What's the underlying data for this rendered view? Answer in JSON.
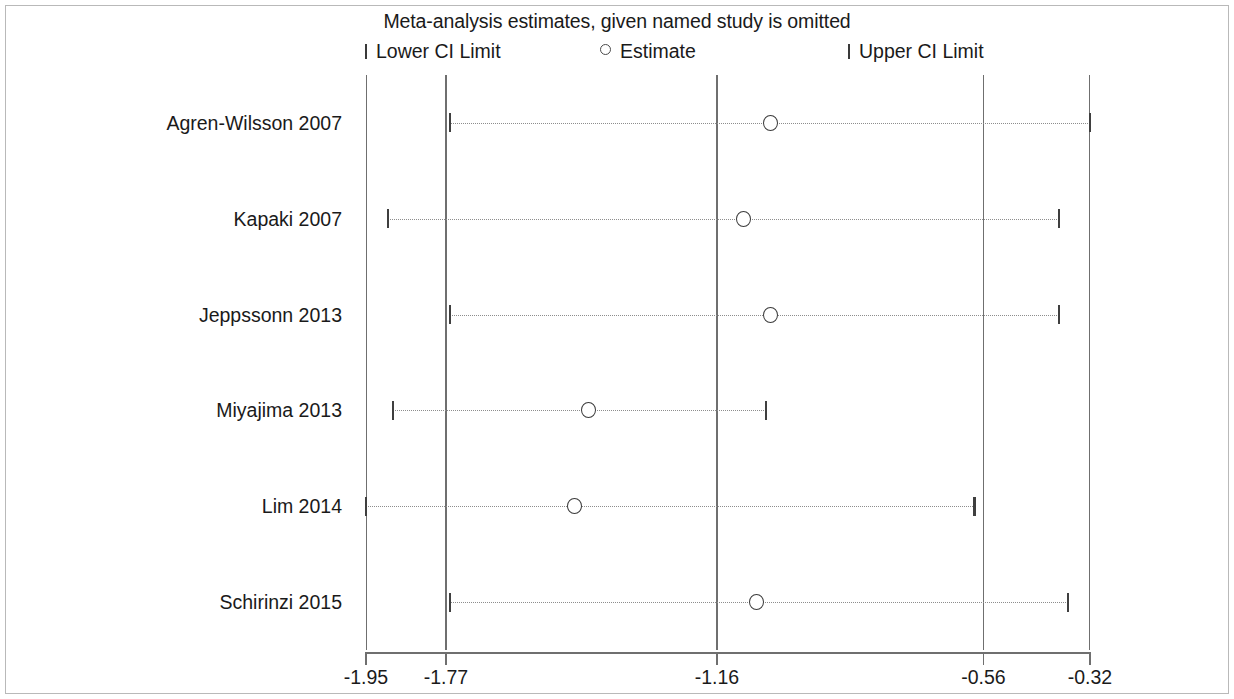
{
  "chart_data": {
    "type": "scatter",
    "title": "Meta-analysis estimates, given named study is omitted",
    "xlabel": "",
    "ylabel": "",
    "xlim": [
      -1.95,
      -0.32
    ],
    "grid": false,
    "legend_position": "top",
    "legend": [
      {
        "key": "lower-ci-limit",
        "marker": "tick",
        "label": "Lower CI Limit"
      },
      {
        "key": "estimate",
        "marker": "circle",
        "label": "Estimate"
      },
      {
        "key": "upper-ci-limit",
        "marker": "tick",
        "label": "Upper CI Limit"
      }
    ],
    "xticks": [
      -1.95,
      -1.77,
      -1.16,
      -0.56,
      -0.32
    ],
    "xticklabels": [
      "-1.95",
      "-1.77",
      "-1.16",
      "-0.56",
      "-0.32"
    ],
    "reference_lines": [
      -1.77,
      -1.16,
      -0.56
    ],
    "categories": [
      "Agren-Wilsson 2007",
      "Kapaki 2007",
      "Jeppssonn 2013",
      "Miyajima 2013",
      "Lim 2014",
      "Schirinzi 2015"
    ],
    "series": [
      {
        "name": "Lower CI Limit",
        "values": [
          -1.76,
          -1.9,
          -1.76,
          -1.89,
          -1.95,
          -1.76
        ]
      },
      {
        "name": "Estimate",
        "values": [
          -1.04,
          -1.1,
          -1.04,
          -1.45,
          -1.48,
          -1.07
        ]
      },
      {
        "name": "Upper CI Limit",
        "values": [
          -0.32,
          -0.39,
          -0.39,
          -1.05,
          -0.58,
          -0.37
        ]
      }
    ],
    "rows": [
      {
        "study": "Agren-Wilsson 2007",
        "lower": -1.76,
        "estimate": -1.04,
        "upper": -0.32
      },
      {
        "study": "Kapaki 2007",
        "lower": -1.9,
        "estimate": -1.1,
        "upper": -0.39
      },
      {
        "study": "Jeppssonn 2013",
        "lower": -1.76,
        "estimate": -1.04,
        "upper": -0.39
      },
      {
        "study": "Miyajima 2013",
        "lower": -1.89,
        "estimate": -1.45,
        "upper": -1.05
      },
      {
        "study": "Lim 2014",
        "lower": -1.95,
        "estimate": -1.48,
        "upper": -0.58
      },
      {
        "study": "Schirinzi 2015",
        "lower": -1.76,
        "estimate": -1.07,
        "upper": -0.37
      }
    ],
    "colors": {
      "marker": "#3a3a3a",
      "ci_line": "#8d8d8d",
      "axis": "#6f6f6f",
      "text": "#1a1a1a",
      "background": "#ffffff",
      "frame": "#b9b9b9"
    }
  }
}
